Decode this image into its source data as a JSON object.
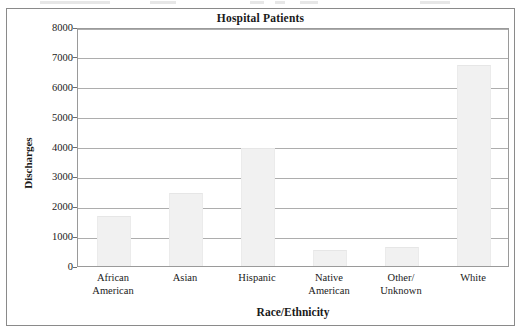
{
  "chart_data": {
    "type": "bar",
    "title": "Hospital Patients",
    "xlabel": "Race/Ethnicity",
    "ylabel": "Discharges",
    "categories": [
      "African American",
      "Asian",
      "Hispanic",
      "Native American",
      "Other/ Unknown",
      "White"
    ],
    "category_lines": [
      [
        "African",
        "American"
      ],
      [
        "Asian",
        ""
      ],
      [
        "Hispanic",
        ""
      ],
      [
        "Native",
        "American"
      ],
      [
        "Other/",
        "Unknown"
      ],
      [
        "White",
        ""
      ]
    ],
    "values": [
      1670,
      2450,
      3940,
      530,
      630,
      6730
    ],
    "ylim": [
      0,
      8000
    ],
    "yticks": [
      0,
      1000,
      2000,
      3000,
      4000,
      5000,
      6000,
      7000,
      8000
    ],
    "ytick_labels": [
      "0",
      "1000",
      "2000",
      "3000",
      "4000",
      "5000",
      "6000",
      "7000",
      "8000"
    ],
    "grid": true,
    "legend": false,
    "bar_color": "#f1f1f1",
    "gridline_color": "#adadad",
    "axis_color": "#9a9a9a",
    "text_color": "#1a1a1a"
  }
}
